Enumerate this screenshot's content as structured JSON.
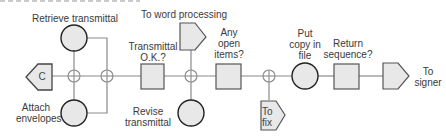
{
  "diagram": {
    "type": "process-flowchart",
    "colors": {
      "shape_fill": "#e8e8e8",
      "shape_stroke": "#555555",
      "circle_stroke": "#222222",
      "line": "#888888",
      "text": "#3a3a3a"
    },
    "nodes": {
      "connector_c": {
        "shape": "off-page-connector-left",
        "label": "C"
      },
      "retrieve_transmittal": {
        "shape": "circle-operation",
        "label": "Retrieve transmittal"
      },
      "attach_envelopes": {
        "shape": "circle-operation",
        "label": "Attach\nenvelopes"
      },
      "transmittal_ok": {
        "shape": "square-inspection",
        "label": "Transmittal\nO.K.?"
      },
      "to_word_processing": {
        "shape": "off-page-connector-right",
        "label": "To word processing"
      },
      "revise_transmittal": {
        "shape": "circle-operation",
        "label": "Revise\ntransmittal"
      },
      "any_open_items": {
        "shape": "square-inspection",
        "label": "Any\nopen\nitems?"
      },
      "to_fix": {
        "shape": "off-page-connector-right",
        "label": "To\nfix"
      },
      "put_copy_in_file": {
        "shape": "circle-operation",
        "label": "Put\ncopy in\nfile"
      },
      "return_sequence": {
        "shape": "square-inspection",
        "label": "Return\nsequence?"
      },
      "to_signer": {
        "shape": "off-page-connector-right",
        "label": "To\nsigner"
      }
    },
    "junctions": [
      "junction-1",
      "junction-2",
      "junction-3",
      "junction-4"
    ]
  }
}
